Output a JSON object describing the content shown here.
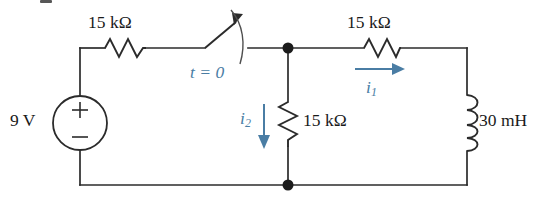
{
  "figure": {
    "name": "rl-circuit-with-switch",
    "background_color": "#ffffff",
    "wire_color": "#2b2b2b",
    "annotation_color": "#4a7da4"
  },
  "source": {
    "type": "dc-voltage-source",
    "value_label": "9 V",
    "plus_sign": "+",
    "minus_sign": "−"
  },
  "switch": {
    "label_t": "t",
    "label_eq": "=",
    "label_zero": "0",
    "full_label": "t = 0"
  },
  "resistors": [
    {
      "id": "r-series-left",
      "value_label": "15 kΩ",
      "orientation": "horizontal"
    },
    {
      "id": "r-shunt-middle",
      "value_label": "15 kΩ",
      "orientation": "vertical"
    },
    {
      "id": "r-series-right",
      "value_label": "15 kΩ",
      "orientation": "horizontal"
    }
  ],
  "inductor": {
    "id": "l-right-branch",
    "value_label": "30 mH",
    "orientation": "vertical",
    "loops": 4
  },
  "currents": [
    {
      "id": "i1",
      "symbol": "i",
      "subscript": "1",
      "direction": "right"
    },
    {
      "id": "i2",
      "symbol": "i",
      "subscript": "2",
      "direction": "down"
    }
  ],
  "nodes": [
    {
      "id": "top-node",
      "x": 288,
      "y": 48
    },
    {
      "id": "bottom-node",
      "x": 288,
      "y": 185
    }
  ]
}
